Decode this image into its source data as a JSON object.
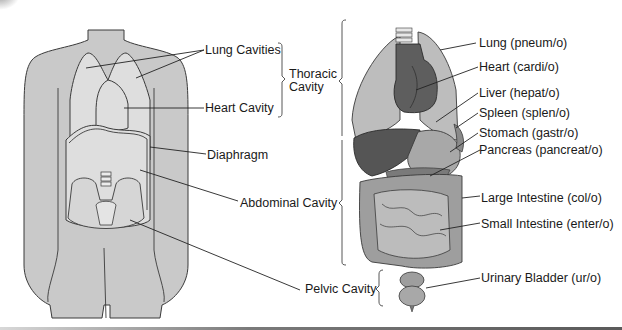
{
  "figure": {
    "left_panel": {
      "subject": "body silhouette with cavities",
      "labels": {
        "lung_cavities": "Lung Cavities",
        "heart_cavity": "Heart Cavity",
        "diaphragm": "Diaphragm",
        "abdominal_cavity": "Abdominal Cavity",
        "pelvic_cavity": "Pelvic Cavity"
      },
      "group_labels": {
        "thoracic_line1": "Thoracic",
        "thoracic_line2": "Cavity"
      }
    },
    "right_panel": {
      "subject": "internal organs",
      "organs": [
        {
          "name": "Lung (pneum/o)"
        },
        {
          "name": "Heart (cardi/o)"
        },
        {
          "name": "Liver (hepat/o)"
        },
        {
          "name": "Spleen (splen/o)"
        },
        {
          "name": "Stomach (gastr/o)"
        },
        {
          "name": "Pancreas (pancreat/o)"
        },
        {
          "name": "Large Intestine (col/o)"
        },
        {
          "name": "Small Intestine (enter/o)"
        },
        {
          "name": "Urinary Bladder (ur/o)"
        }
      ]
    },
    "colors": {
      "body_fill": "#c9c9c9",
      "cavity_fill": "#dedede",
      "outline": "#3a3a3a",
      "lung_fill": "#bdbdbd",
      "heart_fill": "#5e5e5e",
      "liver_fill": "#555555",
      "stomach_fill": "#a8a8a8",
      "intestine_fill": "#9e9e9e",
      "leader_line": "#222222"
    }
  }
}
